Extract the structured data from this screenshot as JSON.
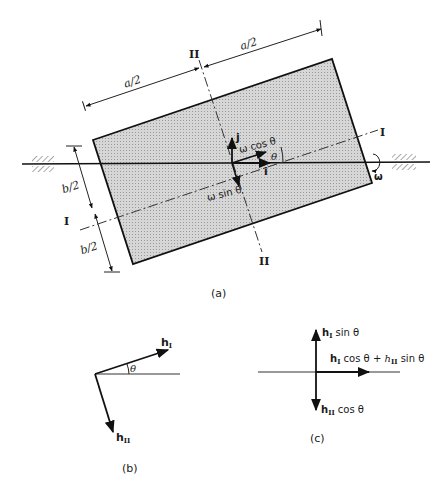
{
  "figure": {
    "panel_a": {
      "caption": "(a)",
      "dim_a_left": "a/2",
      "dim_a_right": "a/2",
      "dim_b_top": "b/2",
      "dim_b_bottom": "b/2",
      "axis_I_top": "I",
      "axis_I_left": "I",
      "axis_II_top": "II",
      "axis_II_bottom": "II",
      "vec_j": "j",
      "vec_i": "i",
      "omega_cos": "ω cos θ",
      "omega_sin": "ω sin θ",
      "theta": "θ",
      "omega": "ω",
      "plate_color": "#cfcfcf"
    },
    "panel_b": {
      "caption": "(b)",
      "h1": "h",
      "h1_sub": "I",
      "h2": "h",
      "h2_sub": "II",
      "theta": "θ"
    },
    "panel_c": {
      "caption": "(c)",
      "top_h": "h",
      "top_sub": "I",
      "top_rest": " sin θ",
      "right_h1": "h",
      "right_sub1": "I",
      "right_mid": " cos θ + ",
      "right_h2": "h",
      "right_sub2": "II",
      "right_rest": " sin θ",
      "bottom_h": "h",
      "bottom_sub": "II",
      "bottom_rest": " cos θ"
    }
  }
}
